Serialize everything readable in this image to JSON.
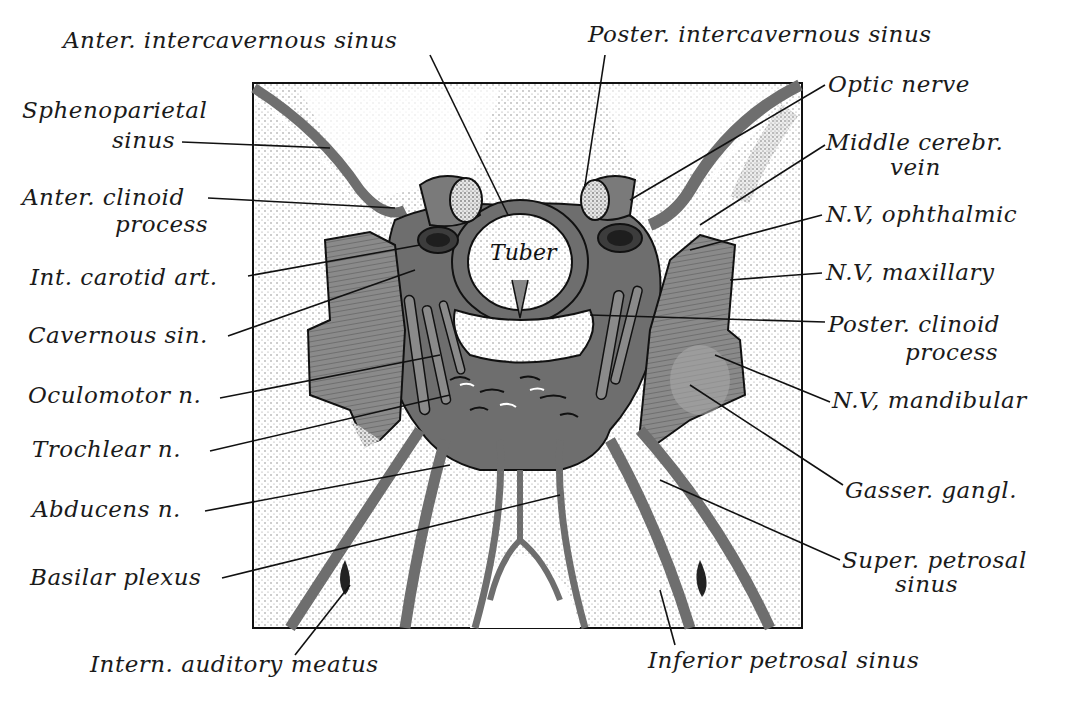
{
  "figure": {
    "type": "anatomical illustration",
    "colors": {
      "ink": "#1a1a1a",
      "vessel_gray": "#6e6e6e",
      "dark_gray": "#4a4a4a",
      "stipple": "#bdbdbd",
      "background": "#ffffff"
    },
    "center_label": "Tuber"
  },
  "labels_left": [
    {
      "id": "spheno",
      "lines": [
        "Sphenoparietal",
        "sinus"
      ]
    },
    {
      "id": "ant_clinoid",
      "lines": [
        "Anter. clinoid",
        "process"
      ]
    },
    {
      "id": "int_carotid",
      "lines": [
        "Int. carotid art."
      ]
    },
    {
      "id": "cavernous",
      "lines": [
        "Cavernous sin."
      ]
    },
    {
      "id": "oculomotor",
      "lines": [
        "Oculomotor n."
      ]
    },
    {
      "id": "trochlear",
      "lines": [
        "Trochlear  n."
      ]
    },
    {
      "id": "abducens",
      "lines": [
        "Abducens n."
      ]
    },
    {
      "id": "basilar",
      "lines": [
        "Basilar plexus"
      ]
    }
  ],
  "labels_top": [
    {
      "id": "ant_interc",
      "lines": [
        "Anter. intercavernous sinus"
      ]
    },
    {
      "id": "post_interc",
      "lines": [
        "Poster. intercavernous sinus"
      ]
    }
  ],
  "labels_right": [
    {
      "id": "optic",
      "lines": [
        "Optic nerve"
      ]
    },
    {
      "id": "mid_cerebr",
      "lines": [
        "Middle cerebr.",
        "vein"
      ]
    },
    {
      "id": "nv_ophth",
      "lines": [
        "N.V, ophthalmic"
      ]
    },
    {
      "id": "nv_max",
      "lines": [
        "N.V, maxillary"
      ]
    },
    {
      "id": "post_clinoid",
      "lines": [
        "Poster. clinoid",
        "process"
      ]
    },
    {
      "id": "nv_mand",
      "lines": [
        "N.V, mandibular"
      ]
    },
    {
      "id": "gasser",
      "lines": [
        "Gasser. gangl."
      ]
    },
    {
      "id": "sup_petrosal",
      "lines": [
        "Super. petrosal",
        "sinus"
      ]
    }
  ],
  "labels_bottom": [
    {
      "id": "int_auditory",
      "lines": [
        "Intern. auditory meatus"
      ]
    },
    {
      "id": "inf_petrosal",
      "lines": [
        "Inferior petrosal sinus"
      ]
    }
  ]
}
